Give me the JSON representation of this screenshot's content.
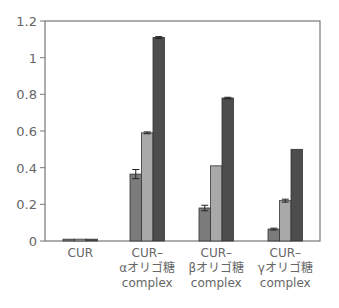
{
  "chart_data": {
    "type": "bar",
    "title": "",
    "xlabel": "",
    "ylabel": "",
    "ylim": [
      0,
      1.2
    ],
    "yticks": [
      0,
      0.2,
      0.4,
      0.6,
      0.8,
      1,
      1.2
    ],
    "ytick_labels": [
      "0",
      "0.2",
      "0.4",
      "0.6",
      "0.8",
      "1",
      "1.2"
    ],
    "grid": false,
    "legend": null,
    "categories": [
      [
        "CUR"
      ],
      [
        "CUR–",
        "αオリゴ糖",
        "complex"
      ],
      [
        "CUR–",
        "βオリゴ糖",
        "complex"
      ],
      [
        "CUR–",
        "γオリゴ糖",
        "complex"
      ]
    ],
    "series": [
      {
        "name": "series-1",
        "color": "#7b7b7b",
        "values": [
          0.01,
          0.365,
          0.18,
          0.065
        ],
        "errors": [
          0,
          0.025,
          0.015,
          0.005
        ]
      },
      {
        "name": "series-2",
        "color": "#a9a9a9",
        "values": [
          0.01,
          0.59,
          0.41,
          0.22
        ],
        "errors": [
          0,
          0.005,
          0,
          0.008
        ]
      },
      {
        "name": "series-3",
        "color": "#4d4d4d",
        "values": [
          0.01,
          1.11,
          0.78,
          0.5
        ],
        "errors": [
          0,
          0.005,
          0.004,
          0
        ]
      }
    ]
  }
}
